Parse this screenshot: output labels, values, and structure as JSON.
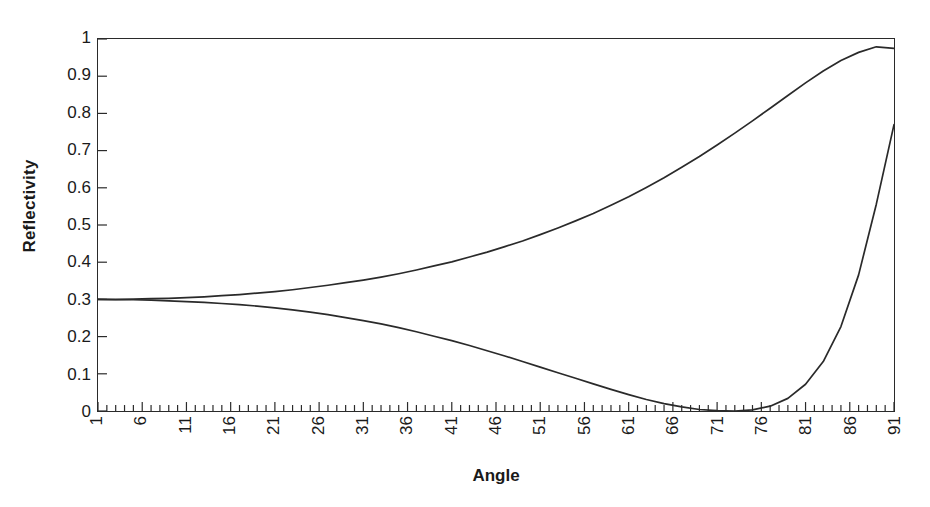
{
  "chart_data": {
    "type": "line",
    "title": "",
    "xlabel": "Angle",
    "ylabel": "Reflectivity",
    "xlim": [
      1,
      91
    ],
    "ylim": [
      0,
      1
    ],
    "grid": false,
    "legend": "none",
    "x_tick_labels": [
      "1",
      "6",
      "11",
      "16",
      "21",
      "26",
      "31",
      "36",
      "41",
      "46",
      "51",
      "56",
      "61",
      "66",
      "71",
      "76",
      "81",
      "86",
      "91"
    ],
    "x_tick_values": [
      1,
      6,
      11,
      16,
      21,
      26,
      31,
      36,
      41,
      46,
      51,
      56,
      61,
      66,
      71,
      76,
      81,
      86,
      91
    ],
    "x_minor_tick_step": 1,
    "y_tick_labels": [
      "0",
      "0.1",
      "0.2",
      "0.3",
      "0.4",
      "0.5",
      "0.6",
      "0.7",
      "0.8",
      "0.9",
      "1"
    ],
    "y_tick_values": [
      0,
      0.1,
      0.2,
      0.3,
      0.4,
      0.5,
      0.6,
      0.7,
      0.8,
      0.9,
      1
    ],
    "x": [
      1,
      3,
      5,
      7,
      9,
      11,
      13,
      15,
      17,
      19,
      21,
      23,
      25,
      27,
      29,
      31,
      33,
      35,
      37,
      39,
      41,
      43,
      45,
      47,
      49,
      51,
      53,
      55,
      57,
      59,
      61,
      63,
      65,
      67,
      69,
      71,
      73,
      75,
      77,
      79,
      81,
      83,
      85,
      87,
      89,
      91
    ],
    "series": [
      {
        "name": "s-polarized",
        "color": "#2a2a2a",
        "values": [
          0.3,
          0.3,
          0.301,
          0.302,
          0.303,
          0.305,
          0.307,
          0.31,
          0.313,
          0.317,
          0.321,
          0.326,
          0.332,
          0.338,
          0.345,
          0.352,
          0.36,
          0.369,
          0.379,
          0.39,
          0.401,
          0.414,
          0.427,
          0.442,
          0.457,
          0.474,
          0.492,
          0.511,
          0.531,
          0.553,
          0.576,
          0.601,
          0.627,
          0.655,
          0.684,
          0.715,
          0.747,
          0.78,
          0.814,
          0.848,
          0.882,
          0.914,
          0.942,
          0.964,
          0.979,
          0.975
        ]
      },
      {
        "name": "p-polarized",
        "color": "#2a2a2a",
        "values": [
          0.3,
          0.299,
          0.299,
          0.298,
          0.296,
          0.294,
          0.292,
          0.289,
          0.286,
          0.282,
          0.277,
          0.272,
          0.266,
          0.259,
          0.251,
          0.243,
          0.234,
          0.224,
          0.213,
          0.201,
          0.189,
          0.176,
          0.162,
          0.148,
          0.133,
          0.118,
          0.103,
          0.088,
          0.073,
          0.058,
          0.044,
          0.031,
          0.02,
          0.011,
          0.004,
          0.001,
          0.0,
          0.003,
          0.013,
          0.034,
          0.072,
          0.133,
          0.227,
          0.366,
          0.556,
          0.77
        ]
      }
    ],
    "curve_endpoints": {
      "s_end_value": 0.975,
      "p_end_value": 0.77,
      "p_minimum_value": 0.0,
      "p_minimum_angle": 73,
      "start_value": 0.3
    }
  },
  "axes": {
    "frame_color": "#2a2a2a",
    "tick_color": "#2a2a2a"
  }
}
